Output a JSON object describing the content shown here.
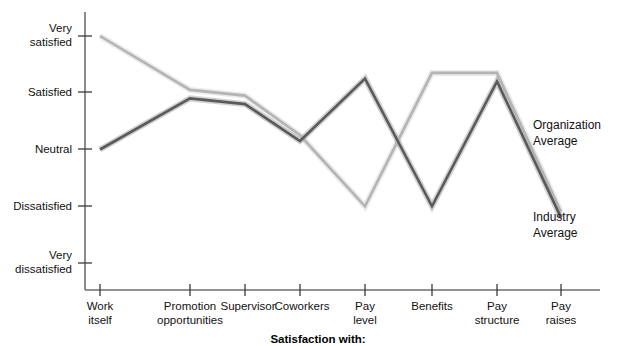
{
  "chart_data": {
    "type": "line",
    "title": "",
    "xlabel": "Satisfaction with:",
    "ylabel": "",
    "grid": false,
    "legend_position": "right-inline",
    "categories": [
      "Work itself",
      "Promotion opportunities",
      "Supervisor",
      "Coworkers",
      "Pay level",
      "Benefits",
      "Pay structure",
      "Pay raises"
    ],
    "category_lines": [
      [
        "Work",
        "itself"
      ],
      [
        "Promotion",
        "opportunities"
      ],
      [
        "Supervisor",
        ""
      ],
      [
        "Coworkers",
        ""
      ],
      [
        "Pay",
        "level"
      ],
      [
        "Benefits",
        ""
      ],
      [
        "Pay",
        "structure"
      ],
      [
        "Pay",
        "raises"
      ]
    ],
    "y_tick_labels": [
      [
        "Very",
        "satisfied"
      ],
      [
        "Satisfied",
        ""
      ],
      [
        "Neutral",
        ""
      ],
      [
        "Dissatisfied",
        ""
      ],
      [
        "Very",
        "dissatisfied"
      ]
    ],
    "y_scale_values": [
      5,
      4,
      3,
      2,
      1
    ],
    "ylim": [
      1,
      5
    ],
    "series": [
      {
        "name": "Organization Average",
        "color": "#b4b4b4",
        "values": [
          5.0,
          4.05,
          3.95,
          3.25,
          2.0,
          4.35,
          4.35,
          1.9
        ]
      },
      {
        "name": "Industry Average",
        "color": "#5a5a5a",
        "values": [
          3.0,
          3.9,
          3.8,
          3.15,
          4.25,
          2.0,
          4.2,
          1.8
        ]
      }
    ]
  },
  "legend": {
    "organization": {
      "line1": "Organization",
      "line2": "Average"
    },
    "industry": {
      "line1": "Industry",
      "line2": "Average"
    }
  },
  "axis": {
    "caption": "Satisfaction with:"
  }
}
